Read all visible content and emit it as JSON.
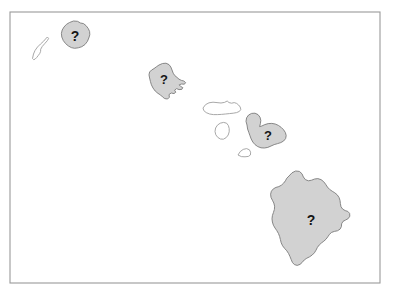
{
  "figure": {
    "kind": "map",
    "region_name": "Hawaiian Islands",
    "frame": {
      "x": 10,
      "y": 12,
      "width": 370,
      "height": 271
    },
    "canvas": {
      "width": 395,
      "height": 299
    },
    "background_color": "#ffffff",
    "frame_stroke_color": "#9a9a9a",
    "highlight_fill_color": "#d2d2d2",
    "highlight_stroke_color": "#7c7c7c",
    "plain_fill_color": "#ffffff",
    "plain_stroke_color": "#9e9e9e",
    "marker_color": "#151515"
  },
  "markers": [
    {
      "id": "marker-kauai",
      "label": "?",
      "x": 75,
      "y": 36,
      "font_size": 14,
      "on_island": "kauai"
    },
    {
      "id": "marker-oahu",
      "label": "?",
      "x": 164,
      "y": 79,
      "font_size": 13,
      "on_island": "oahu"
    },
    {
      "id": "marker-maui",
      "label": "?",
      "x": 268,
      "y": 135,
      "font_size": 13,
      "on_island": "maui"
    },
    {
      "id": "marker-hawaii",
      "label": "?",
      "x": 311,
      "y": 220,
      "font_size": 14,
      "on_island": "hawaii"
    }
  ],
  "islands": [
    {
      "id": "niihau",
      "name": "Niihau",
      "style": "plain",
      "labeled": false,
      "path": "M 32.5 58.5 L 33.5 54.0 L 35.0 50.5 L 37.5 47.0 L 40.5 44.0 L 43.5 41.3 L 45.5 39.0 L 47.3 37.0 L 48.6 38.4 L 47.4 40.6 L 45.0 43.3 L 42.3 46.4 L 40.7 49.2 L 40.6 51.4 L 39.8 53.4 L 38.2 55.6 L 36.6 57.6 L 35.0 59.2 L 33.6 59.6 Z"
    },
    {
      "id": "kauai",
      "name": "Kauai",
      "style": "highlight",
      "labeled": true,
      "path": "M 69.5 22.5 L 73.5 21.0 L 77.5 21.3 L 80.5 23.0 L 83.5 23.6 L 86.0 25.6 L 88.2 28.4 L 89.6 31.5 L 89.8 34.8 L 88.8 38.0 L 87.4 41.4 L 85.0 44.5 L 81.8 46.7 L 78.3 47.8 L 74.6 48.3 L 71.3 47.6 L 68.3 45.9 L 65.6 43.6 L 63.3 40.6 L 61.8 37.0 L 61.4 33.4 L 62.2 30.0 L 64.0 27.0 L 66.4 24.4 Z"
    },
    {
      "id": "oahu",
      "name": "Oahu",
      "style": "highlight",
      "labeled": true,
      "path": "M 159.0 65.0 L 162.5 63.5 L 166.0 63.2 L 169.0 64.6 L 170.8 67.0 L 172.0 70.0 L 173.2 73.2 L 174.8 75.6 L 177.0 77.4 L 179.0 79.2 L 181.4 80.4 L 183.8 81.0 L 185.6 82.6 L 184.4 84.2 L 181.6 84.0 L 179.2 84.8 L 180.6 86.4 L 182.8 87.6 L 181.8 89.4 L 179.0 89.6 L 176.6 88.6 L 174.6 90.2 L 175.8 92.2 L 174.0 93.6 L 171.2 93.0 L 169.0 94.6 L 169.4 97.2 L 167.6 99.0 L 164.8 98.6 L 162.6 97.0 L 160.6 95.0 L 158.0 93.4 L 155.2 91.0 L 153.0 88.0 L 151.4 84.8 L 150.4 81.4 L 149.6 78.0 L 149.0 74.8 L 149.6 72.0 L 151.6 70.0 L 154.0 68.6 L 156.4 66.8 Z"
    },
    {
      "id": "molokai",
      "name": "Molokai",
      "style": "plain",
      "labeled": false,
      "path": "M 203.0 108.0 L 205.6 104.6 L 209.0 102.8 L 213.0 102.2 L 217.0 102.6 L 221.0 103.0 L 224.5 102.4 L 227.2 101.0 L 229.0 102.6 L 231.6 103.2 L 234.2 102.6 L 236.6 103.4 L 238.6 105.0 L 240.2 107.0 L 240.8 109.4 L 239.4 111.4 L 236.6 112.6 L 233.2 113.2 L 229.4 113.6 L 225.4 114.0 L 221.4 114.4 L 217.4 114.6 L 213.4 114.6 L 209.6 114.0 L 206.2 112.6 L 203.8 110.6 Z"
    },
    {
      "id": "lanai",
      "name": "Lanai",
      "style": "plain",
      "labeled": false,
      "path": "M 215.0 131.5 L 215.6 128.0 L 217.4 125.2 L 220.2 123.2 L 223.6 122.4 L 226.6 123.2 L 228.4 125.6 L 229.2 128.6 L 229.2 131.8 L 228.2 135.0 L 226.2 137.6 L 223.4 139.2 L 220.4 139.0 L 217.8 137.4 L 215.8 134.8 Z"
    },
    {
      "id": "kahoolawe",
      "name": "Kahoolawe",
      "style": "plain",
      "labeled": false,
      "path": "M 238.0 155.0 L 240.2 151.6 L 243.2 149.4 L 246.6 148.6 L 249.4 149.8 L 250.6 152.2 L 250.4 155.0 L 248.4 156.4 L 245.0 156.8 L 241.4 156.6 Z"
    },
    {
      "id": "maui",
      "name": "Maui",
      "style": "highlight",
      "labeled": true,
      "path": "M 247.0 125.0 L 246.0 121.4 L 246.6 117.8 L 248.6 115.0 L 251.6 113.4 L 255.0 113.2 L 258.0 114.6 L 260.0 117.2 L 260.8 120.4 L 260.4 123.6 L 259.6 126.6 L 261.8 126.0 L 264.8 124.6 L 268.2 123.6 L 271.8 123.4 L 275.2 124.0 L 278.4 125.4 L 281.2 127.4 L 283.6 129.8 L 285.4 132.6 L 286.2 135.6 L 285.6 138.6 L 283.6 141.0 L 280.8 142.6 L 277.6 143.6 L 274.2 144.6 L 271.0 146.0 L 267.8 147.4 L 264.4 148.0 L 261.0 147.8 L 257.8 146.6 L 255.0 144.6 L 252.8 142.0 L 251.2 139.0 L 250.0 135.8 L 248.8 132.4 L 247.6 129.0 Z"
    },
    {
      "id": "hawaii",
      "name": "Hawaii",
      "style": "highlight",
      "labeled": true,
      "path": "M 289.0 176.0 L 292.0 172.8 L 295.6 171.0 L 299.4 171.4 L 302.0 173.8 L 303.4 177.0 L 305.4 179.6 L 308.4 180.8 L 311.6 180.2 L 314.6 179.0 L 317.8 178.6 L 321.0 179.6 L 323.6 181.6 L 325.6 184.2 L 327.4 187.0 L 329.6 189.4 L 332.2 191.2 L 334.8 192.8 L 337.2 194.8 L 339.0 197.4 L 340.0 200.4 L 340.4 203.6 L 341.0 206.8 L 342.8 209.2 L 345.2 210.6 L 347.8 211.4 L 349.6 213.4 L 349.8 216.2 L 348.2 218.6 L 345.6 220.0 L 343.0 221.4 L 341.6 223.8 L 341.4 226.6 L 340.0 229.2 L 337.4 230.8 L 334.4 231.4 L 331.6 232.4 L 329.4 234.4 L 327.8 236.8 L 326.0 239.2 L 323.8 241.2 L 321.4 243.0 L 319.2 245.0 L 317.4 247.4 L 316.0 250.2 L 314.4 252.8 L 312.2 255.0 L 309.6 256.8 L 306.8 258.2 L 304.2 260.0 L 302.2 262.4 L 300.0 264.4 L 297.2 265.4 L 294.4 264.6 L 292.4 262.4 L 291.2 259.6 L 290.0 256.6 L 288.6 253.6 L 286.8 250.8 L 284.6 248.4 L 282.6 245.8 L 281.2 242.8 L 280.4 239.6 L 279.6 236.4 L 278.4 233.4 L 276.8 230.6 L 275.0 228.0 L 273.4 225.2 L 272.4 222.0 L 272.0 218.8 L 272.4 215.6 L 273.4 212.6 L 274.4 209.4 L 274.6 206.2 L 273.8 203.0 L 272.4 200.2 L 271.0 197.4 L 270.6 194.2 L 271.4 191.2 L 273.4 188.8 L 276.0 187.4 L 278.8 186.6 L 281.4 185.2 L 283.6 183.2 L 285.4 180.8 L 286.8 178.2 Z"
    }
  ]
}
